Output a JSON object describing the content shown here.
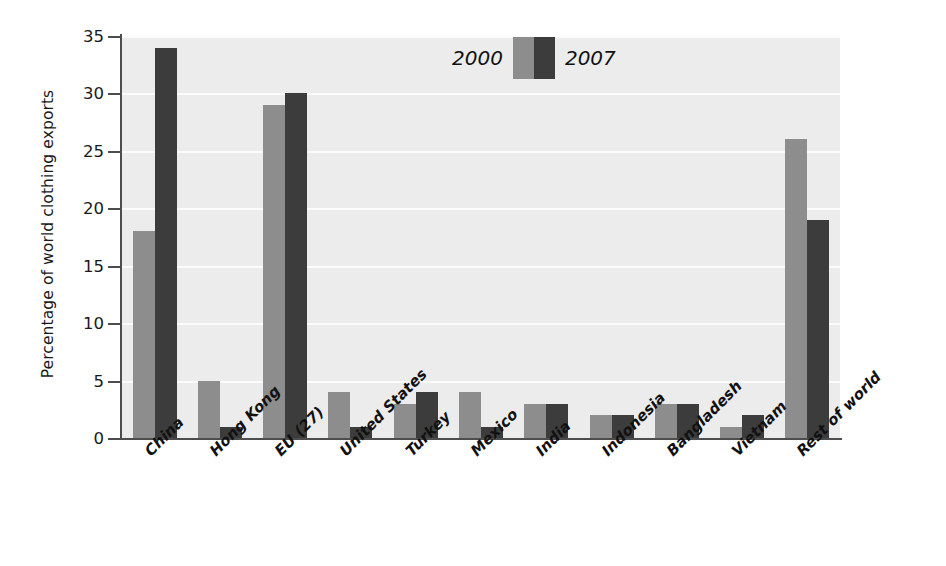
{
  "chart_data": {
    "type": "bar",
    "title": "",
    "xlabel": "",
    "ylabel": "Percentage of world clothing exports",
    "ylim": [
      0,
      35
    ],
    "ytick_labels": [
      "0",
      "5",
      "10",
      "15",
      "20",
      "25",
      "30",
      "35"
    ],
    "yticks": [
      0,
      5,
      10,
      15,
      20,
      25,
      30,
      35
    ],
    "grid": true,
    "legend_position": "top-center",
    "categories": [
      "China",
      "Hong Kong",
      "EU (27)",
      "United States",
      "Turkey",
      "Mexico",
      "India",
      "Indonesia",
      "Bangladesh",
      "Vietnam",
      "Rest of world"
    ],
    "series": [
      {
        "name": "2000",
        "color": "#8d8d8d",
        "values": [
          18,
          5,
          29,
          4,
          3,
          4,
          3,
          2,
          3,
          1,
          26
        ]
      },
      {
        "name": "2007",
        "color": "#3c3c3c",
        "values": [
          34,
          1,
          30,
          1,
          4,
          1,
          3,
          2,
          3,
          2,
          19
        ]
      }
    ]
  },
  "legend": {
    "entries": [
      {
        "label": "2000",
        "swatch": "legend-swatch-2000"
      },
      {
        "label": "2007",
        "swatch": "legend-swatch-2007"
      }
    ]
  },
  "colors": {
    "plot_background": "#ececec",
    "gridline": "#fbfbfb",
    "axis": "#4d4d4d",
    "text": "#111111",
    "series_2000": "#8d8d8d",
    "series_2007": "#3c3c3c"
  }
}
